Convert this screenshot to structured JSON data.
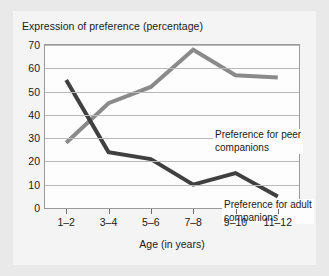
{
  "figure": {
    "title": "Expression of preference (percentage)",
    "background_color": "#e9e9e9",
    "panel_color": "#f4f4f4",
    "plot_color": "#fdfdfd"
  },
  "chart_data": {
    "type": "line",
    "title": "Expression of preference (percentage)",
    "xlabel": "Age (in years)",
    "ylabel": "",
    "categories": [
      "1–2",
      "3–4",
      "5–6",
      "7–8",
      "9–10",
      "11–12"
    ],
    "ylim": [
      0,
      70
    ],
    "yticks": [
      0,
      10,
      20,
      30,
      40,
      50,
      60,
      70
    ],
    "grid": true,
    "legend": "in-plot annotations",
    "series": [
      {
        "name": "Preference for peer companions",
        "color": "#8a8a8a",
        "values": [
          28,
          45,
          52,
          68,
          57,
          56
        ]
      },
      {
        "name": "Preference for adult companions",
        "color": "#404040",
        "values": [
          55,
          24,
          21,
          10,
          15,
          5
        ]
      }
    ],
    "annotations": [
      {
        "name": "peer-label",
        "line1": "Preference for peer",
        "line2": "companions"
      },
      {
        "name": "adult-label",
        "line1": "Preference for adult",
        "line2": "companions"
      }
    ]
  }
}
